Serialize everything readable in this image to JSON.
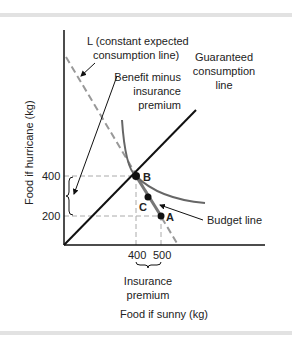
{
  "diagram": {
    "y_axis_label": "Food if hurricane (kg)",
    "x_axis_label": "Food if sunny (kg)",
    "y_ticks": [
      "400",
      "200"
    ],
    "x_ticks": [
      "400",
      "500"
    ],
    "points": {
      "A": "A",
      "B": "B",
      "C": "C"
    },
    "labels": {
      "l_line_1": "L (constant expected",
      "l_line_2": "consumption line)",
      "guaranteed_1": "Guaranteed",
      "guaranteed_2": "consumption",
      "guaranteed_3": "line",
      "benefit_1": "Benefit minus",
      "benefit_2": "insurance",
      "benefit_3": "premium",
      "budget": "Budget line",
      "premium_1": "Insurance",
      "premium_2": "premium"
    },
    "colors": {
      "axis": "#111111",
      "curve": "#666666",
      "dashed": "#999999",
      "budget": "#777777"
    }
  }
}
